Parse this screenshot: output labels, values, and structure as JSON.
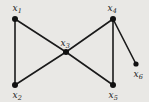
{
  "figure": {
    "type": "undirected-graph-diagram",
    "background_color": "#e9e8e5",
    "stroke_color": "#1a1a1a",
    "node_fill_color": "#111111",
    "width": 149,
    "height": 102
  },
  "chart_data": {
    "type": "graph",
    "title": "",
    "nodes": [
      {
        "id": "x1",
        "label": "x",
        "subscript": "1",
        "x": 15,
        "y": 19,
        "label_x": 17,
        "label_y": 8,
        "r": 3.0
      },
      {
        "id": "x2",
        "label": "x",
        "subscript": "2",
        "x": 15,
        "y": 85,
        "label_x": 17,
        "label_y": 95,
        "r": 3.0
      },
      {
        "id": "x3",
        "label": "x",
        "subscript": "3",
        "x": 66,
        "y": 52,
        "label_x": 65,
        "label_y": 43,
        "r": 3.0
      },
      {
        "id": "x4",
        "label": "x",
        "subscript": "4",
        "x": 113,
        "y": 19,
        "label_x": 112,
        "label_y": 8,
        "r": 3.0
      },
      {
        "id": "x5",
        "label": "x",
        "subscript": "5",
        "x": 113,
        "y": 85,
        "label_x": 113,
        "label_y": 95,
        "r": 3.0
      },
      {
        "id": "x6",
        "label": "x",
        "subscript": "6",
        "x": 136,
        "y": 64,
        "label_x": 138,
        "label_y": 74,
        "r": 2.6
      }
    ],
    "edges": [
      {
        "source": "x1",
        "target": "x2"
      },
      {
        "source": "x1",
        "target": "x3"
      },
      {
        "source": "x2",
        "target": "x3"
      },
      {
        "source": "x3",
        "target": "x4"
      },
      {
        "source": "x3",
        "target": "x5"
      },
      {
        "source": "x4",
        "target": "x5"
      },
      {
        "source": "x4",
        "target": "x6"
      }
    ],
    "edge_width": 1.6
  }
}
